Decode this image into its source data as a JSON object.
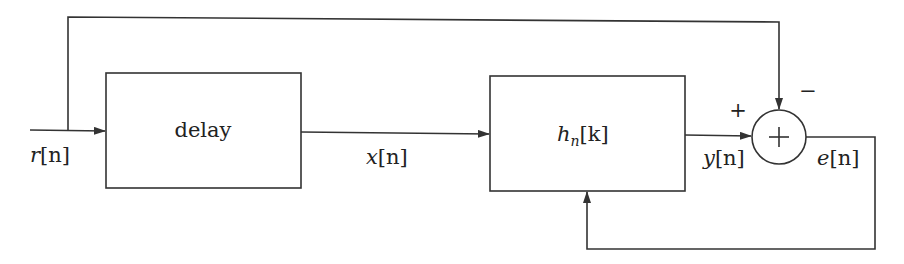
{
  "diagram": {
    "type": "block-diagram",
    "blocks": [
      {
        "id": "delay",
        "label": "delay"
      },
      {
        "id": "filter",
        "label": "h_n[k]",
        "label_base": "h",
        "label_sub": "n",
        "label_arg": "[k]"
      }
    ],
    "summing_junction": {
      "symbol": "+",
      "input_signs": {
        "left": "+",
        "top": "−"
      }
    },
    "signals": {
      "input": "r[n]",
      "delayed": "x[n]",
      "filter_output": "y[n]",
      "error": "e[n]"
    },
    "signal_parts": {
      "r": {
        "var": "r",
        "arg": "[n]"
      },
      "x": {
        "var": "x",
        "arg": "[n]"
      },
      "y": {
        "var": "y",
        "arg": "[n]"
      },
      "e": {
        "var": "e",
        "arg": "[n]"
      }
    },
    "signs": {
      "plus": "+",
      "minus": "−"
    },
    "edges": [
      {
        "from": "input",
        "to": "delay",
        "label": "r[n]"
      },
      {
        "from": "input",
        "to": "summing_junction",
        "sign": "−",
        "note": "bypass path over top"
      },
      {
        "from": "delay",
        "to": "filter",
        "label": "x[n]"
      },
      {
        "from": "filter",
        "to": "summing_junction",
        "label": "y[n]",
        "sign": "+"
      },
      {
        "from": "summing_junction",
        "to": "filter",
        "label": "e[n]",
        "note": "feedback to filter adaptation input"
      }
    ]
  }
}
